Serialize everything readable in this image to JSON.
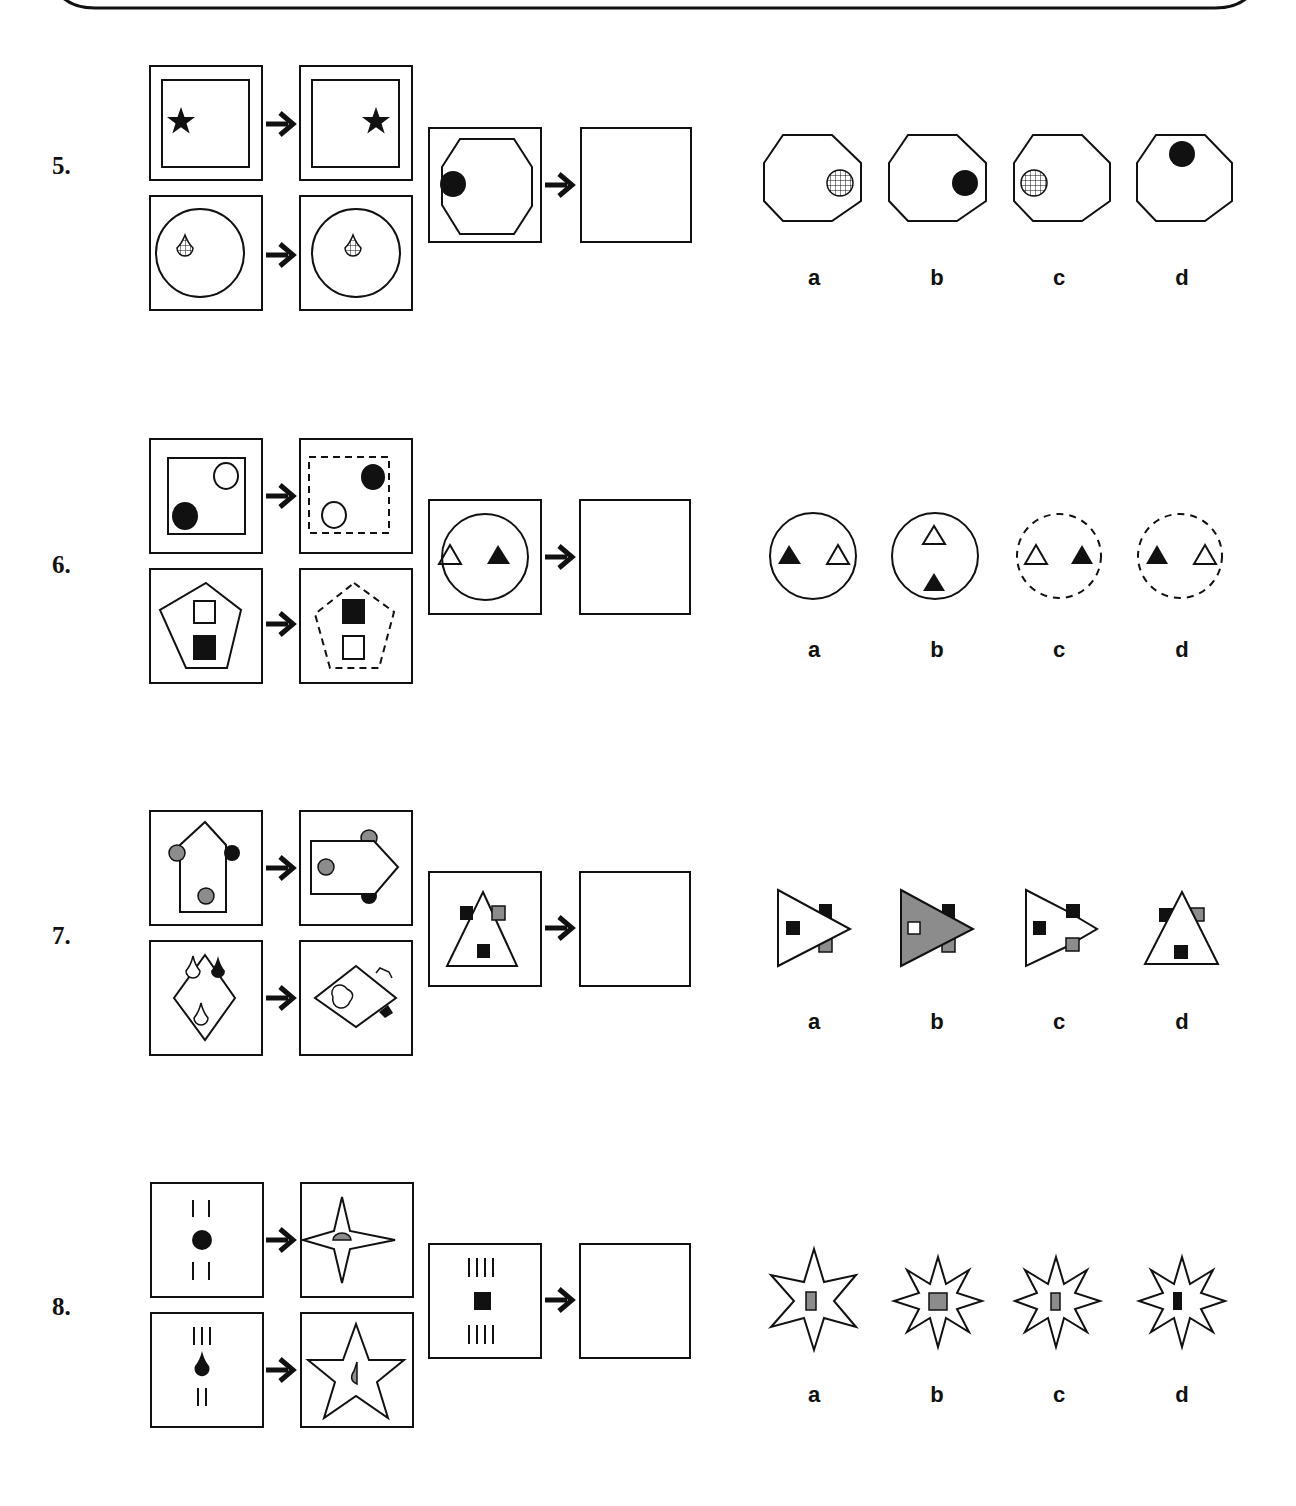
{
  "page": {
    "type": "non-verbal reasoning worksheet",
    "instruction_implied": "Choose the figure that completes the analogy"
  },
  "questions": [
    {
      "number": "5.",
      "examples": [
        {
          "from": "star in double square, left",
          "to": "star in double square, right"
        },
        {
          "from": "hatched drop in circle, left",
          "to": "hatched drop in circle, right"
        }
      ],
      "question": "black dot in octagon, left",
      "options": [
        {
          "letter": "a",
          "description": "octagon with hatched circle on right"
        },
        {
          "letter": "b",
          "description": "octagon with black dot on right"
        },
        {
          "letter": "c",
          "description": "octagon with hatched circle on left"
        },
        {
          "letter": "d",
          "description": "octagon with black dot at top"
        }
      ]
    },
    {
      "number": "6.",
      "examples": [
        {
          "from": "square with white circle top-right, black circle bottom-left",
          "to": "dashed square with black circle top-right, white circle bottom-left"
        },
        {
          "from": "pentagon with white square top, black square bottom",
          "to": "dashed pentagon with black square top, white square bottom"
        }
      ],
      "question": "circle with white triangle left, black triangle right",
      "options": [
        {
          "letter": "a",
          "description": "solid circle, black triangle left, white triangle right"
        },
        {
          "letter": "b",
          "description": "solid circle, white triangle top, black triangle bottom"
        },
        {
          "letter": "c",
          "description": "dashed circle, white triangle left, black triangle right"
        },
        {
          "letter": "d",
          "description": "dashed circle, black triangle left, white triangle right"
        }
      ]
    },
    {
      "number": "7.",
      "examples": [
        {
          "from": "house shape with grey, black, grey circles",
          "to": "house rotated right"
        },
        {
          "from": "diamond with white, black, white drops",
          "to": "diamond rotated right"
        }
      ],
      "question": "triangle with black and grey squares at top, black square inside",
      "options": [
        {
          "letter": "a",
          "description": "white triangle pointing right"
        },
        {
          "letter": "b",
          "description": "grey triangle pointing right with white square"
        },
        {
          "letter": "c",
          "description": "white arrow-pentagon pointing right"
        },
        {
          "letter": "d",
          "description": "white triangle pointing up"
        }
      ]
    },
    {
      "number": "8.",
      "examples": [
        {
          "from": "2 lines, black dot, 2 lines",
          "to": "4-point star with grey half-dot"
        },
        {
          "from": "3 lines, black drop, 2 lines",
          "to": "5-point star with grey half-drop"
        }
      ],
      "question": "4 lines, black square, 4 lines",
      "options": [
        {
          "letter": "a",
          "description": "7-point star with grey narrow rectangle"
        },
        {
          "letter": "b",
          "description": "8-point star with grey square"
        },
        {
          "letter": "c",
          "description": "8-point star with grey narrow rectangle"
        },
        {
          "letter": "d",
          "description": "8-point star with black narrow rectangle"
        }
      ]
    }
  ],
  "colors": {
    "ink": "#111111",
    "grey_fill": "#8c8c8c",
    "background": "#ffffff"
  }
}
